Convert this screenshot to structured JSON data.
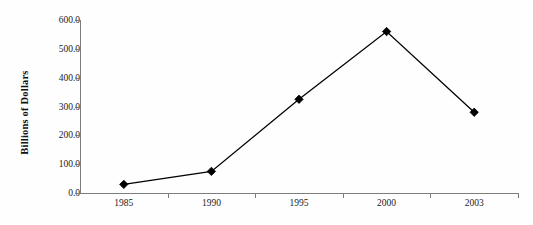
{
  "chart_data": {
    "type": "line",
    "title": "",
    "xlabel": "",
    "ylabel": "Billions of Dollars",
    "categories": [
      "1985",
      "1990",
      "1995",
      "2000",
      "2003"
    ],
    "values": [
      30.0,
      75.0,
      325.0,
      560.0,
      280.0
    ],
    "series": [
      {
        "name": "Billions of Dollars",
        "values": [
          30.0,
          75.0,
          325.0,
          560.0,
          280.0
        ]
      }
    ],
    "ylim": [
      0.0,
      600.0
    ],
    "ytick_values": [
      0.0,
      100.0,
      200.0,
      300.0,
      400.0,
      500.0,
      600.0
    ],
    "ytick_labels": [
      "0.0",
      "100.0",
      "200.0",
      "300.0",
      "400.0",
      "500.0",
      "600.0"
    ],
    "xtick_labels": [
      "1985",
      "1990",
      "1995",
      "2000",
      "2003"
    ],
    "grid": false,
    "legend": false,
    "legend_position": "none",
    "marker": "diamond",
    "line_color": "#000000",
    "marker_color": "#000000",
    "background_color": "#fefefe",
    "axis_color": "#7d7d7d"
  }
}
